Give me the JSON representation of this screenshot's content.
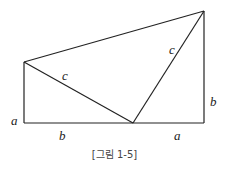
{
  "figure": {
    "caption": "[그림 1-5]",
    "labels": {
      "left_height": "a",
      "bottom_left": "b",
      "hyp_left": "c",
      "hyp_right": "c",
      "right_height": "b",
      "bottom_right": "a"
    },
    "stroke_color": "#222222"
  }
}
